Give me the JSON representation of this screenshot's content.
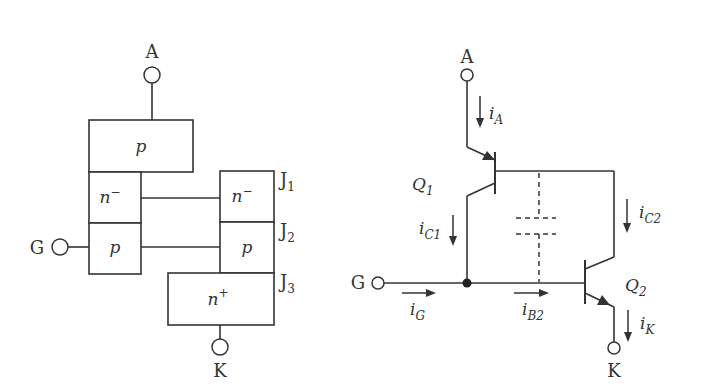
{
  "structure_diagram": {
    "terminals": {
      "anode": "A",
      "gate": "G",
      "cathode": "K"
    },
    "regions": {
      "top_p": "p",
      "left_n": "n",
      "left_n_sup": "−",
      "left_p": "p",
      "right_n": "n",
      "right_n_sup": "−",
      "right_p": "p",
      "bottom_n": "n",
      "bottom_n_sup": "+"
    },
    "junctions": [
      {
        "base": "J",
        "sub": "1"
      },
      {
        "base": "J",
        "sub": "2"
      },
      {
        "base": "J",
        "sub": "3"
      }
    ]
  },
  "equivalent_circuit": {
    "terminals": {
      "anode": "A",
      "gate": "G",
      "cathode": "K"
    },
    "transistors": [
      {
        "base": "Q",
        "sub": "1",
        "type": "pnp"
      },
      {
        "base": "Q",
        "sub": "2",
        "type": "npn"
      }
    ],
    "currents": {
      "iA": {
        "base": "i",
        "sub": "A"
      },
      "iC1": {
        "base": "i",
        "sub": "C1"
      },
      "iC2": {
        "base": "i",
        "sub": "C2"
      },
      "iG": {
        "base": "i",
        "sub": "G"
      },
      "iB2": {
        "base": "i",
        "sub": "B2"
      },
      "iK": {
        "base": "i",
        "sub": "K"
      }
    }
  },
  "colors": {
    "line": "#333333",
    "background": "#ffffff"
  }
}
